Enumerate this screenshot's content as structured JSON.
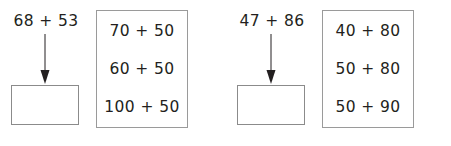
{
  "page": {
    "background_color": "#ffffff",
    "text_color": "#231f20",
    "box_border_color": "#8b8b8b",
    "arrow_color": "#231f20"
  },
  "problems": [
    {
      "expression": "68 + 53",
      "answer_value": "",
      "arrow": "down-arrow",
      "options": [
        "70 + 50",
        "60 + 50",
        "100 + 50"
      ]
    },
    {
      "expression": "47 + 86",
      "answer_value": "",
      "arrow": "down-arrow",
      "options": [
        "40 + 80",
        "50 + 80",
        "50 + 90"
      ]
    }
  ]
}
